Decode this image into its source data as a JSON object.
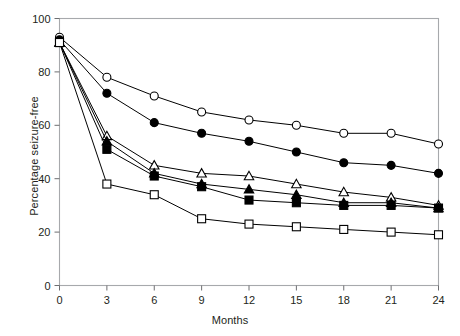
{
  "chart_data": {
    "type": "line",
    "title": "",
    "xlabel": "Months",
    "ylabel": "Percentage seizure-free",
    "xlim": [
      0,
      24
    ],
    "ylim": [
      0,
      100
    ],
    "xticks": [
      0,
      3,
      6,
      9,
      12,
      15,
      18,
      21,
      24
    ],
    "yticks": [
      0,
      20,
      40,
      60,
      80,
      100
    ],
    "xtick_labels": [
      "0",
      "3",
      "6",
      "9",
      "12",
      "15",
      "18",
      "21",
      "24"
    ],
    "ytick_labels": [
      "0",
      "20",
      "40",
      "60",
      "80",
      "100"
    ],
    "grid": false,
    "legend": "none",
    "x": [
      0,
      3,
      6,
      9,
      12,
      15,
      18,
      21,
      24
    ],
    "series": [
      {
        "name": "open-circle",
        "marker": "circle-open",
        "values": [
          93,
          78,
          71,
          65,
          62,
          60,
          57,
          57,
          53
        ]
      },
      {
        "name": "filled-circle",
        "marker": "circle-filled",
        "values": [
          92,
          72,
          61,
          57,
          54,
          50,
          46,
          45,
          42
        ]
      },
      {
        "name": "open-triangle",
        "marker": "triangle-open",
        "values": [
          91,
          56,
          45,
          42,
          41,
          38,
          35,
          33,
          30
        ]
      },
      {
        "name": "filled-triangle",
        "marker": "triangle-filled",
        "values": [
          91,
          54,
          42,
          38,
          36,
          34,
          31,
          31,
          29
        ]
      },
      {
        "name": "filled-square",
        "marker": "square-filled",
        "values": [
          91,
          51,
          41,
          37,
          32,
          31,
          30,
          30,
          29
        ]
      },
      {
        "name": "open-square",
        "marker": "square-open",
        "values": [
          91,
          38,
          34,
          25,
          23,
          22,
          21,
          20,
          19
        ]
      }
    ]
  }
}
